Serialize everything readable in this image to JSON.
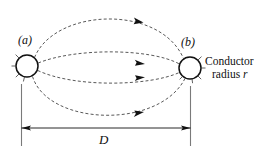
{
  "figure": {
    "labels": {
      "conductor_a": "(a)",
      "conductor_b": "(b)",
      "separation": "D",
      "conductor_caption_line1": "Conductor",
      "conductor_caption_line2": "radius",
      "conductor_caption_symbol": "r"
    },
    "colors": {
      "line": "#111111",
      "flux": "#3a3a3a",
      "background": "#ffffff",
      "extension": "#6e6e6e"
    },
    "geometry": {
      "conductor_a_center_x": 27,
      "conductor_a_center_y": 66,
      "conductor_b_center_x": 190,
      "conductor_b_center_y": 68,
      "conductor_radius": 11,
      "dimension_line_y": 128,
      "separation_value_label": "D"
    },
    "flux_arcs": [
      {
        "name": "outer-top-arc",
        "direction": "left-to-right",
        "arrow_at_x": 140,
        "arrow_at_y": 21
      },
      {
        "name": "inner-upper-arc",
        "direction": "left-to-right",
        "arrow_at_x": 141,
        "arrow_at_y": 62
      },
      {
        "name": "inner-lower-arc",
        "direction": "left-to-right",
        "arrow_at_x": 141,
        "arrow_at_y": 78
      },
      {
        "name": "outer-bottom-arc",
        "direction": "left-to-right",
        "arrow_at_x": 140,
        "arrow_at_y": 115
      }
    ]
  }
}
